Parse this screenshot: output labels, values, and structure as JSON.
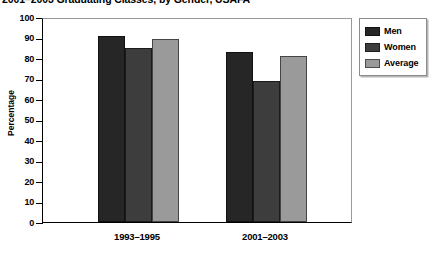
{
  "chart_data": {
    "type": "bar",
    "title": "2001–2003 Graduating Classes, by Gender, USAFA",
    "xlabel": "",
    "ylabel": "Percentage",
    "ylim": [
      0,
      100
    ],
    "ytick_step": 10,
    "yticks": [
      "100",
      "90",
      "80",
      "70",
      "60",
      "50",
      "40",
      "30",
      "20",
      "10",
      "0"
    ],
    "grid": false,
    "legend_position": "right",
    "categories": [
      "1993–1995",
      "2001–2003"
    ],
    "series": [
      {
        "name": "Men",
        "color": "#262626",
        "values": [
          90.5,
          83.0
        ]
      },
      {
        "name": "Women",
        "color": "#3d3d3d",
        "values": [
          85.0,
          69.0
        ]
      },
      {
        "name": "Average",
        "color": "#9a9a9a",
        "values": [
          89.5,
          81.0
        ]
      }
    ]
  },
  "legend": {
    "items": [
      {
        "label": "Men",
        "color": "#262626"
      },
      {
        "label": "Women",
        "color": "#3d3d3d"
      },
      {
        "label": "Average",
        "color": "#9a9a9a"
      }
    ]
  }
}
